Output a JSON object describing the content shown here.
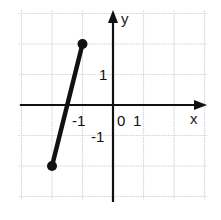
{
  "chart_data": {
    "type": "line",
    "title": "",
    "xlabel": "x",
    "ylabel": "y",
    "xlim": [
      -3,
      3
    ],
    "ylim": [
      -3,
      3
    ],
    "grid": true,
    "tick_labels": {
      "x": [
        "-1",
        "0",
        "1"
      ],
      "y": [
        "1",
        "-1"
      ]
    },
    "series": [
      {
        "name": "segment",
        "points": [
          [
            -2,
            -2
          ],
          [
            -1,
            2
          ]
        ],
        "endpoints": "closed"
      }
    ]
  },
  "labels": {
    "x_axis": "x",
    "y_axis": "y",
    "origin": "0",
    "x_neg1": "-1",
    "x_pos1": "1",
    "y_pos1": "1",
    "y_neg1": "-1"
  }
}
